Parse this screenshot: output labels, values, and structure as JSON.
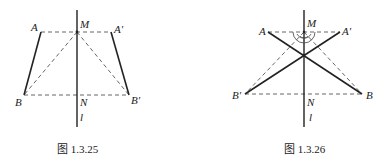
{
  "figures": [
    {
      "id": "fig-1-3-25",
      "caption": "图 1.3.25",
      "labels": {
        "A": "A",
        "A_prime": "A'",
        "B": "B",
        "B_prime": "B'",
        "M": "M",
        "N": "N",
        "l": "l"
      },
      "points": {
        "A": [
          41,
          32
        ],
        "A_prime": [
          111,
          32
        ],
        "B": [
          24,
          95
        ],
        "B_prime": [
          129,
          95
        ],
        "M": [
          77,
          32
        ],
        "N": [
          77,
          95
        ]
      },
      "axis": {
        "x": 77,
        "y1": 10,
        "y2": 127
      },
      "solid_segments": [
        [
          "A",
          "B"
        ],
        [
          "A_prime",
          "B_prime"
        ]
      ],
      "dashed_segments": [
        [
          "A",
          "A_prime"
        ],
        [
          "B",
          "B_prime"
        ],
        [
          "M",
          "B"
        ],
        [
          "M",
          "B_prime"
        ]
      ]
    },
    {
      "id": "fig-1-3-26",
      "caption": "图 1.3.26",
      "labels": {
        "A": "A",
        "A_prime": "A'",
        "B": "B",
        "B_prime": "B'",
        "M": "M",
        "N": "N",
        "l": "l"
      },
      "points": {
        "A": [
          268,
          32
        ],
        "A_prime": [
          340,
          32
        ],
        "B": [
          362,
          94
        ],
        "B_prime": [
          245,
          94
        ],
        "M": [
          304,
          32
        ],
        "N": [
          304,
          94
        ]
      },
      "axis": {
        "x": 304,
        "y1": 10,
        "y2": 127
      },
      "solid_segments": [
        [
          "A",
          "B"
        ],
        [
          "A_prime",
          "B_prime"
        ]
      ],
      "dashed_segments": [
        [
          "A",
          "A_prime"
        ],
        [
          "B_prime",
          "B"
        ],
        [
          "M",
          "B_prime"
        ],
        [
          "M",
          "B"
        ]
      ],
      "angle_arcs_at": "M"
    }
  ]
}
